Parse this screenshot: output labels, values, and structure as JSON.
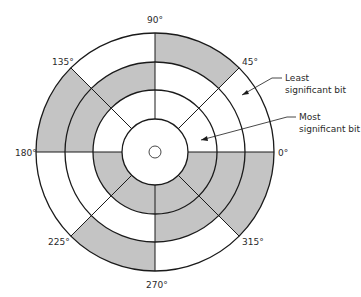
{
  "diagram": {
    "title": "",
    "center": [
      155,
      152
    ],
    "ring_radii": {
      "hub": 6,
      "inner": 33,
      "msb_outer": 62,
      "mid_outer": 90,
      "outer": 119
    },
    "colors": {
      "shaded": "#c4c4c4",
      "line": "#1a1a1a",
      "background": "#ffffff"
    },
    "tracks": [
      {
        "name": "Most significant bit",
        "r_in": 33,
        "r_out": 62,
        "shaded_sectors": [
          [
            180,
            360
          ]
        ]
      },
      {
        "name": "Middle bit",
        "r_in": 62,
        "r_out": 90,
        "shaded_sectors": [
          [
            90,
            180
          ],
          [
            270,
            360
          ]
        ]
      },
      {
        "name": "Least significant bit",
        "r_in": 90,
        "r_out": 119,
        "shaded_sectors": [
          [
            45,
            90
          ],
          [
            135,
            180
          ],
          [
            225,
            270
          ],
          [
            315,
            360
          ]
        ]
      }
    ],
    "radial_divisions_deg": [
      0,
      45,
      90,
      135,
      180,
      225,
      270,
      315
    ],
    "angle_labels": [
      {
        "text": "90°",
        "x": 147,
        "y": 20
      },
      {
        "text": "45°",
        "x": 242,
        "y": 58
      },
      {
        "text": "135°",
        "x": 52,
        "y": 58
      },
      {
        "text": "180°",
        "x": 17,
        "y": 148
      },
      {
        "text": "0°",
        "x": 278,
        "y": 148
      },
      {
        "text": "225°",
        "x": 48,
        "y": 238
      },
      {
        "text": "315°",
        "x": 242,
        "y": 238
      },
      {
        "text": "270°",
        "x": 146,
        "y": 280
      }
    ],
    "annotations": [
      {
        "line1": "Least",
        "line2": "significant bit",
        "x": 284,
        "y": 73
      },
      {
        "line1": "Most",
        "line2": "significant bit",
        "x": 298,
        "y": 112
      }
    ]
  }
}
